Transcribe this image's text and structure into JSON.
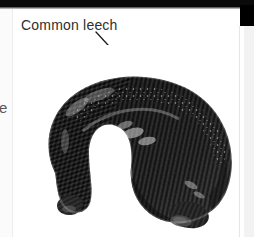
{
  "figure": {
    "label": "Common leech",
    "pointer": {
      "icon": "arrow-icon",
      "direction": "down-right",
      "from": [
        100,
        33
      ],
      "to": [
        136,
        71
      ]
    },
    "photograph": {
      "icon": "leech-photo",
      "subject": "Common leech",
      "style": "black-and-white photograph",
      "description": "Curved arch-shaped segmented leech body, dark with pale speckled highlights, posterior sucker at lower right",
      "background_color": "#ffffff",
      "body_dark_color": "#1e1e1e",
      "body_mid_color": "#4a4a4a",
      "body_light_color": "#c9c9c9",
      "highlight_color": "#f0f0f0"
    }
  },
  "page": {
    "top_rule_color": "#0a0a0a",
    "corner_block_color": "#000000",
    "right_panel_color": "#f2f2f2",
    "gutter_bleed_text": "e",
    "page_background": "#ffffff",
    "caption_color": "#2e2e2e"
  }
}
